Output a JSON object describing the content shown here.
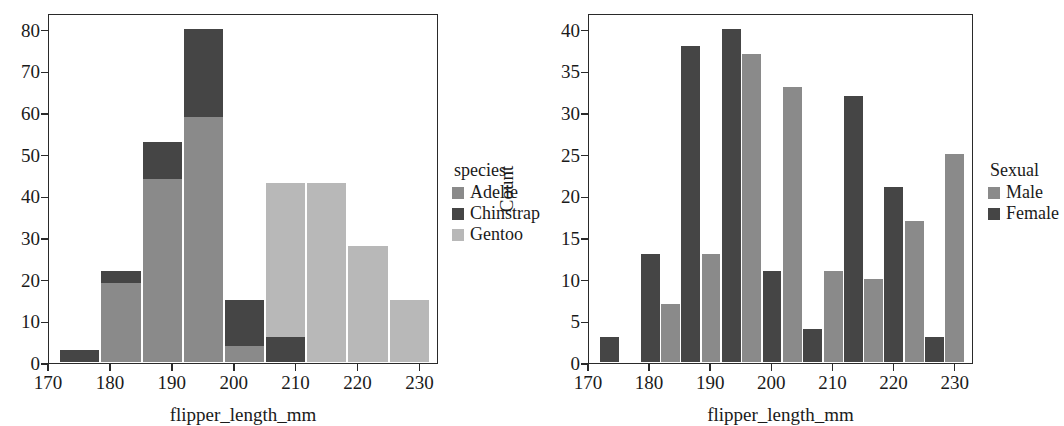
{
  "figure": {
    "kind": "two-panel-histogram-figure"
  },
  "chart_data": [
    {
      "type": "bar",
      "panel": "left",
      "subtype": "stacked-histogram",
      "title": "",
      "xlabel": "flipper_length_mm",
      "ylabel": "Count",
      "xlim": [
        170,
        233
      ],
      "ylim": [
        0,
        84
      ],
      "xticks": [
        170,
        180,
        190,
        200,
        210,
        220,
        230
      ],
      "yticks": [
        0,
        10,
        20,
        30,
        40,
        50,
        60,
        70,
        80
      ],
      "grid": false,
      "legend": {
        "title": "species",
        "position": "right",
        "entries": [
          {
            "name": "Adelie",
            "color": "#8a8a8a"
          },
          {
            "name": "Chinstrap",
            "color": "#454545"
          },
          {
            "name": "Gentoo",
            "color": "#b8b8b8"
          }
        ]
      },
      "bin_edges": [
        172,
        178.6,
        185.3,
        191.9,
        198.6,
        205.2,
        211.9,
        218.5,
        225.2,
        231.8
      ],
      "bin_centers": [
        175.3,
        182.0,
        188.6,
        195.2,
        201.9,
        208.5,
        215.2,
        221.8,
        228.5
      ],
      "series": [
        {
          "name": "Adelie",
          "color": "#8a8a8a",
          "values": [
            0,
            19,
            44,
            59,
            4,
            0,
            0,
            0,
            0
          ]
        },
        {
          "name": "Chinstrap",
          "color": "#454545",
          "values": [
            3,
            3,
            9,
            21,
            11,
            6,
            0,
            0,
            0
          ]
        },
        {
          "name": "Gentoo",
          "color": "#b8b8b8",
          "values": [
            0,
            0,
            0,
            0,
            0,
            37,
            43,
            28,
            15
          ]
        }
      ],
      "stack_totals": [
        3,
        22,
        53,
        80,
        15,
        43,
        43,
        28,
        15
      ]
    },
    {
      "type": "bar",
      "panel": "right",
      "subtype": "grouped-histogram",
      "title": "",
      "xlabel": "flipper_length_mm",
      "ylabel": "Count",
      "xlim": [
        170,
        233
      ],
      "ylim": [
        0,
        42
      ],
      "xticks": [
        170,
        180,
        190,
        200,
        210,
        220,
        230
      ],
      "yticks": [
        0,
        5,
        10,
        15,
        20,
        25,
        30,
        35,
        40
      ],
      "grid": false,
      "legend": {
        "title": "Sexual",
        "position": "right",
        "entries": [
          {
            "name": "Male",
            "color": "#8a8a8a"
          },
          {
            "name": "Female",
            "color": "#454545"
          }
        ]
      },
      "bin_edges": [
        172,
        178.6,
        185.3,
        191.9,
        198.6,
        205.2,
        211.9,
        218.5,
        225.2,
        231.8
      ],
      "bin_centers": [
        175.3,
        182.0,
        188.6,
        195.2,
        201.9,
        208.5,
        215.2,
        221.8,
        228.5
      ],
      "series": [
        {
          "name": "Female",
          "color": "#454545",
          "values": [
            3,
            13,
            38,
            40,
            11,
            4,
            32,
            21,
            3
          ]
        },
        {
          "name": "Male",
          "color": "#8a8a8a",
          "values": [
            0,
            7,
            13,
            37,
            33,
            11,
            10,
            17,
            25
          ]
        }
      ],
      "series_order_note": "Female bar drawn left of Male bar within each bin slot; slots are offset by half a bin"
    }
  ]
}
